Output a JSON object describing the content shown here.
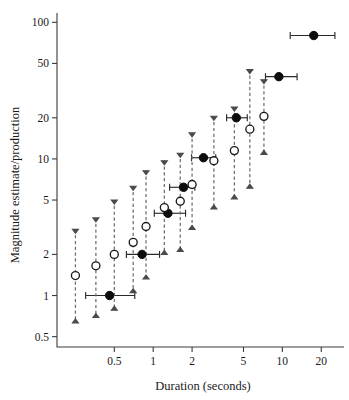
{
  "chart_data": {
    "type": "scatter",
    "title": "",
    "xlabel": "Duration (seconds)",
    "ylabel": "Magnitude estimate/production",
    "xscale": "log",
    "yscale": "log",
    "xlim": [
      0.18,
      30
    ],
    "ylim": [
      0.42,
      115
    ],
    "xticks": [
      0.5,
      1,
      2,
      5,
      10,
      20
    ],
    "xticklabels": [
      "0.5",
      "1",
      "2",
      "5",
      "10",
      "20"
    ],
    "yticks": [
      0.5,
      1,
      2,
      5,
      10,
      20,
      50,
      100
    ],
    "yticklabels": [
      "0.5",
      "1",
      "2",
      "5",
      "10",
      "20",
      "50",
      "100"
    ],
    "grid": false,
    "legend": false,
    "series": [
      {
        "name": "production",
        "marker": "filled-circle",
        "color": "#0d0d0d",
        "errorbar_orientation": "horizontal",
        "points": [
          {
            "x": 0.46,
            "y": 1.0,
            "xlo": 0.3,
            "xhi": 0.72
          },
          {
            "x": 0.82,
            "y": 2.0,
            "xlo": 0.62,
            "xhi": 1.12
          },
          {
            "x": 1.3,
            "y": 4.0,
            "xlo": 1.02,
            "xhi": 1.78
          },
          {
            "x": 1.72,
            "y": 6.2,
            "xlo": 1.34,
            "xhi": 2.1
          },
          {
            "x": 2.45,
            "y": 10.2,
            "xlo": 1.98,
            "xhi": 3.05
          },
          {
            "x": 4.4,
            "y": 20.0,
            "xlo": 3.7,
            "xhi": 5.35
          },
          {
            "x": 9.4,
            "y": 40.0,
            "xlo": 7.4,
            "xhi": 13.0
          },
          {
            "x": 17.5,
            "y": 80.0,
            "xlo": 11.5,
            "xhi": 25.5
          }
        ]
      },
      {
        "name": "magnitude estimate",
        "marker": "open-circle",
        "color": "#1a1a1a",
        "errorbar_orientation": "vertical",
        "points": [
          {
            "x": 0.25,
            "y": 1.4,
            "ylo": 0.63,
            "yhi": 3.05
          },
          {
            "x": 0.36,
            "y": 1.65,
            "ylo": 0.69,
            "yhi": 3.7
          },
          {
            "x": 0.5,
            "y": 2.0,
            "ylo": 0.78,
            "yhi": 5.0
          },
          {
            "x": 0.7,
            "y": 2.45,
            "ylo": 1.05,
            "yhi": 6.3
          },
          {
            "x": 0.88,
            "y": 3.2,
            "ylo": 1.32,
            "yhi": 8.2
          },
          {
            "x": 1.22,
            "y": 4.4,
            "ylo": 2.0,
            "yhi": 9.7
          },
          {
            "x": 1.62,
            "y": 4.9,
            "ylo": 2.1,
            "yhi": 11.0
          },
          {
            "x": 2.0,
            "y": 6.5,
            "ylo": 3.05,
            "yhi": 15.5
          },
          {
            "x": 2.95,
            "y": 9.7,
            "ylo": 4.3,
            "yhi": 20.5
          },
          {
            "x": 4.25,
            "y": 11.5,
            "ylo": 5.1,
            "yhi": 24.0
          },
          {
            "x": 5.6,
            "y": 16.5,
            "ylo": 6.1,
            "yhi": 45.0
          },
          {
            "x": 7.2,
            "y": 20.5,
            "ylo": 10.8,
            "yhi": 38.0
          }
        ]
      }
    ]
  },
  "figure": {
    "xlabel": "Duration (seconds)",
    "ylabel": "Magnitude estimate/production"
  }
}
